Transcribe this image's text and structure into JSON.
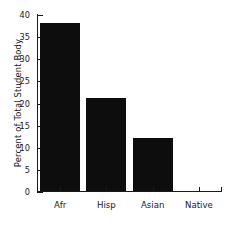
{
  "chart_data": {
    "type": "bar",
    "title": "",
    "xlabel": "",
    "ylabel": "Percent of Total Student Body",
    "categories": [
      "Afr",
      "Hisp",
      "Asian",
      "Native"
    ],
    "values": [
      38,
      21,
      12,
      0
    ],
    "ylim": [
      0,
      40
    ],
    "yticks": [
      0,
      5,
      10,
      15,
      20,
      25,
      30,
      35,
      40
    ],
    "ytick_labels": [
      "0",
      "5",
      "10",
      "15",
      "20",
      "25",
      "30",
      "35",
      "40"
    ],
    "grid": false,
    "legend": null,
    "bar_color": "#0d0d0d",
    "axis_color": "#1a1a1a"
  },
  "axes": {
    "y_title": "Percent of Total Student Body"
  }
}
